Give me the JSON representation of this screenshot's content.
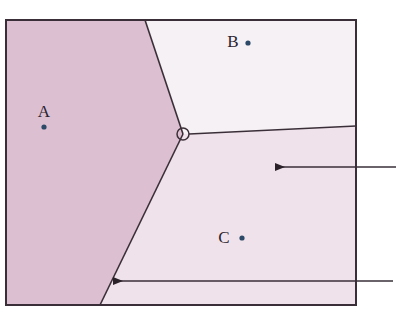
{
  "figure": {
    "type": "voronoi-diagram",
    "title": "",
    "background_color": "#ffffff",
    "frame": {
      "x": 6,
      "y": 20,
      "width": 350,
      "height": 285,
      "stroke_color": "#3a2f38",
      "stroke_width": 2
    }
  },
  "regions": [
    {
      "id": "A",
      "label": "A",
      "fill_color": "#ddbfd2",
      "label_x": 44,
      "label_y": 117,
      "polygon": "6,20 145,20 183,134 100,305 6,305"
    },
    {
      "id": "B",
      "label": "B",
      "fill_color": "#f6f1f4",
      "label_x": 233,
      "label_y": 47,
      "polygon": "145,20 356,20 356,126 189,134 183,134"
    },
    {
      "id": "C",
      "label": "C",
      "fill_color": "#f0e2ea",
      "label_x": 224,
      "label_y": 243,
      "polygon": "183,134 189,134 356,126 356,305 100,305"
    }
  ],
  "sites": [
    {
      "id": "site-a",
      "label": "A",
      "x": 44,
      "y": 127,
      "color": "#2c4a68",
      "radius": 2.6
    },
    {
      "id": "site-b",
      "label": "B",
      "x": 248,
      "y": 43,
      "color": "#2c4a68",
      "radius": 2.6
    },
    {
      "id": "site-c",
      "label": "C",
      "x": 242,
      "y": 238,
      "color": "#2c4a68",
      "radius": 2.6
    }
  ],
  "vertex": {
    "id": "voronoi-vertex",
    "x": 183,
    "y": 134,
    "radius": 6,
    "stroke_color": "#3a2f38",
    "fill_color": "none"
  },
  "edges": [
    {
      "id": "edge-ab",
      "x1": 145,
      "y1": 20,
      "x2": 183,
      "y2": 134
    },
    {
      "id": "edge-ac",
      "x1": 183,
      "y1": 134,
      "x2": 100,
      "y2": 305
    },
    {
      "id": "edge-bc",
      "x1": 189,
      "y1": 134,
      "x2": 356,
      "y2": 126
    }
  ],
  "annotations": [
    {
      "id": "annotation-arrow-upper",
      "tip_x": 275,
      "tip_y": 167,
      "tail_x": 396,
      "tail_y": 167,
      "label": ""
    },
    {
      "id": "annotation-arrow-lower",
      "tip_x": 113,
      "tip_y": 281,
      "tail_x": 393,
      "tail_y": 281,
      "label": ""
    }
  ],
  "colors": {
    "line": "#3a2f38",
    "site": "#2c4a68",
    "region_a": "#ddbfd2",
    "region_b": "#f6f1f4",
    "region_c": "#f0e2ea",
    "page_background": "#ffffff"
  }
}
